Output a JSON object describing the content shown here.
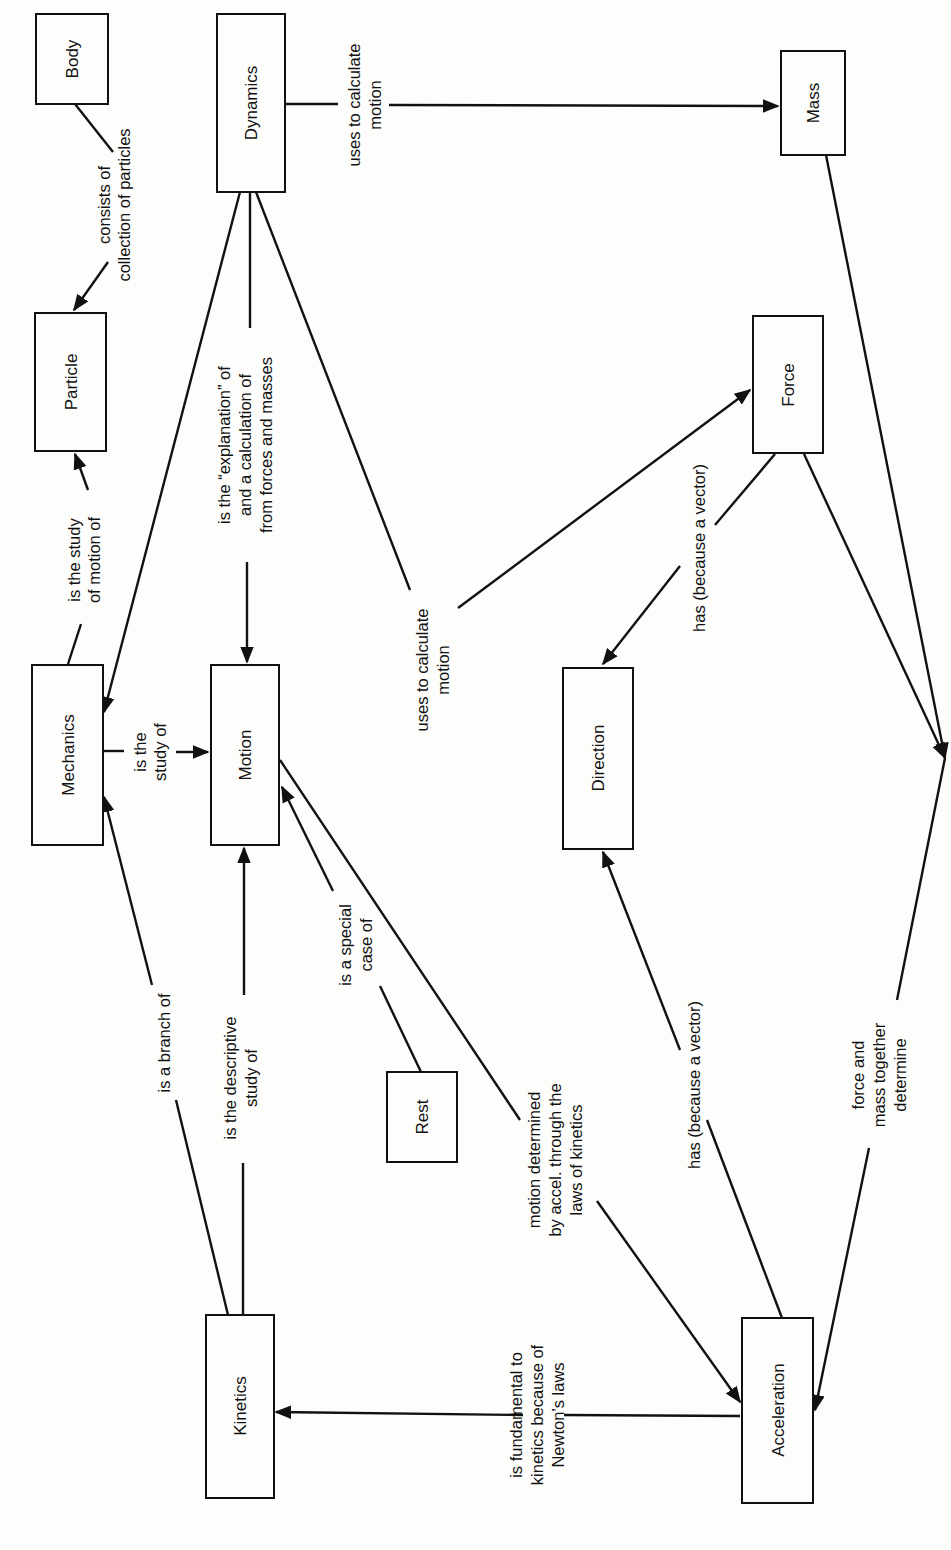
{
  "orientation": "rotated 90 degrees clockwise",
  "nodes": [
    {
      "id": "body",
      "label": "Body",
      "x": 36,
      "y": 14,
      "w": 72,
      "h": 90
    },
    {
      "id": "dynamics",
      "label": "Dynamics",
      "x": 217,
      "y": 14,
      "w": 68,
      "h": 178
    },
    {
      "id": "mass",
      "label": "Mass",
      "x": 781,
      "y": 51,
      "w": 64,
      "h": 104
    },
    {
      "id": "particle",
      "label": "Particle",
      "x": 35,
      "y": 313,
      "w": 71,
      "h": 138
    },
    {
      "id": "force",
      "label": "Force",
      "x": 753,
      "y": 316,
      "w": 70,
      "h": 137
    },
    {
      "id": "mechanics",
      "label": "Mechanics",
      "x": 32,
      "y": 665,
      "w": 71,
      "h": 180
    },
    {
      "id": "motion",
      "label": "Motion",
      "x": 211,
      "y": 665,
      "w": 68,
      "h": 180
    },
    {
      "id": "direction",
      "label": "Direction",
      "x": 563,
      "y": 668,
      "w": 70,
      "h": 181
    },
    {
      "id": "rest",
      "label": "Rest",
      "x": 387,
      "y": 1072,
      "w": 70,
      "h": 90
    },
    {
      "id": "kinetics",
      "label": "Kinetics",
      "x": 206,
      "y": 1315,
      "w": 68,
      "h": 183
    },
    {
      "id": "acceleration",
      "label": "Acceleration",
      "x": 742,
      "y": 1318,
      "w": 71,
      "h": 185
    }
  ],
  "edges": [
    {
      "from": "body",
      "to": "particle",
      "label": [
        "consists of",
        "collection of particles"
      ]
    },
    {
      "from": "mechanics",
      "to": "particle",
      "label": [
        "is the study",
        "of motion of"
      ]
    },
    {
      "from": "dynamics",
      "to": "mechanics",
      "label": []
    },
    {
      "from": "dynamics",
      "to": "motion",
      "label": [
        "is the “explanation” of",
        "and a calculation of",
        "from forces and masses"
      ]
    },
    {
      "from": "dynamics",
      "to": "force",
      "label": [
        "uses to calculate",
        "motion"
      ]
    },
    {
      "from": "dynamics",
      "to": "mass",
      "label": [
        "uses to calculate",
        "motion"
      ]
    },
    {
      "from": "mechanics",
      "to": "motion",
      "label": [
        "is the",
        "study of"
      ]
    },
    {
      "from": "kinetics",
      "to": "mechanics",
      "label": [
        "is a branch of"
      ]
    },
    {
      "from": "kinetics",
      "to": "motion",
      "label": [
        "is the descriptive",
        "study of"
      ]
    },
    {
      "from": "rest",
      "to": "motion",
      "label": [
        "is a special",
        "case of"
      ]
    },
    {
      "from": "motion",
      "to": "acceleration",
      "label": [
        "motion determined",
        "by accel. through the",
        "laws of kinetics"
      ]
    },
    {
      "from": "force",
      "to": "direction",
      "label": [
        "has    (because a vector)"
      ]
    },
    {
      "from": "acceleration",
      "to": "direction",
      "label": [
        "has    (because a vector)"
      ]
    },
    {
      "from": "acceleration",
      "to": "kinetics",
      "label": [
        "is fundamental to",
        "kinetics because of",
        "Newton’s laws"
      ]
    },
    {
      "from": "force+mass",
      "to": "acceleration",
      "label": [
        "force and",
        "mass together",
        "determine"
      ]
    }
  ]
}
